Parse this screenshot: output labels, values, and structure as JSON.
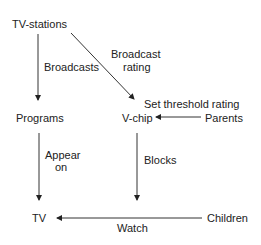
{
  "diagram": {
    "type": "flow",
    "nodes": {
      "tv_stations": "TV-stations",
      "programs": "Programs",
      "v_chip": "V-chip",
      "parents": "Parents",
      "tv": "TV",
      "children": "Children"
    },
    "edges": [
      {
        "from": "TV-stations",
        "to": "Programs",
        "label": "Broadcasts"
      },
      {
        "from": "TV-stations",
        "to": "V-chip",
        "label": "Broadcast rating"
      },
      {
        "from": "Parents",
        "to": "V-chip",
        "label": "Set threshold rating"
      },
      {
        "from": "Programs",
        "to": "TV",
        "label": "Appear on"
      },
      {
        "from": "V-chip",
        "to": "TV",
        "label": "Blocks"
      },
      {
        "from": "Children",
        "to": "TV",
        "label": "Watch"
      }
    ],
    "labels": {
      "broadcasts": "Broadcasts",
      "broadcast_rating_1": "Broadcast",
      "broadcast_rating_2": "rating",
      "set_threshold": "Set threshold rating",
      "appear_on_1": "Appear",
      "appear_on_2": "on",
      "blocks": "Blocks",
      "watch": "Watch"
    },
    "colors": {
      "line": "#333333",
      "text": "#222222",
      "background": "#ffffff"
    }
  }
}
